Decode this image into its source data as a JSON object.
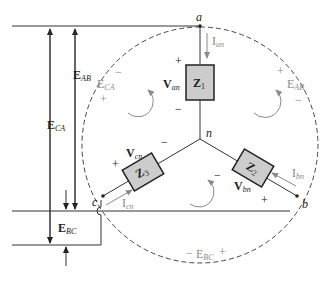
{
  "diagram": {
    "type": "three-phase-wye-load",
    "colors": {
      "line": "#333333",
      "gray_text": "#8a8a8a",
      "box_fill": "#cccccc",
      "box_stroke": "#222222",
      "dashed": "#333333"
    },
    "nodes": {
      "a": "a",
      "b": "b",
      "c": "c",
      "n": "n"
    },
    "impedances": {
      "z1": {
        "main": "Z",
        "sub": "1"
      },
      "z2": {
        "main": "Z",
        "sub": "2"
      },
      "z3": {
        "main": "Z",
        "sub": "3"
      }
    },
    "phase_voltages": {
      "van": {
        "main": "V",
        "sub": "an",
        "plus": "+",
        "minus": "−"
      },
      "vbn": {
        "main": "V",
        "sub": "bn",
        "plus": "+",
        "minus": "−"
      },
      "vcn": {
        "main": "V",
        "sub": "cn",
        "plus": "+",
        "minus": "−"
      }
    },
    "currents": {
      "ian": {
        "main": "I",
        "sub": "an"
      },
      "ibn": {
        "main": "I",
        "sub": "bn"
      },
      "icn": {
        "main": "I",
        "sub": "cn"
      }
    },
    "line_voltages_inner": {
      "eab": {
        "main": "E",
        "sub": "AB",
        "plus": "+",
        "minus": "−"
      },
      "eca": {
        "main": "E",
        "sub": "CA",
        "plus": "+",
        "minus": "−"
      },
      "ebc": {
        "main": "E",
        "sub": "BC",
        "plus": "+",
        "minus": "−"
      }
    },
    "line_voltages_outer": {
      "eab": {
        "main": "E",
        "sub": "AB"
      },
      "eca": {
        "main": "E",
        "sub": "CA"
      },
      "ebc": {
        "main": "E",
        "sub": "BC"
      }
    }
  }
}
